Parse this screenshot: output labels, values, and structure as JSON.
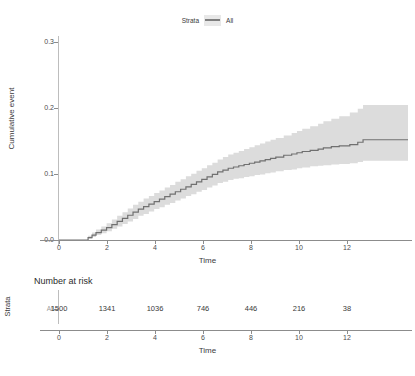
{
  "legend": {
    "title": "Strata",
    "key_icon": "line-swatch-icon",
    "label": "All"
  },
  "km_panel": {
    "y_axis_title": "Cumulative event",
    "x_axis_title": "Time",
    "y_ticks": [
      "0.0",
      "0.1",
      "0.2",
      "0.3"
    ],
    "x_ticks": [
      "0",
      "2",
      "4",
      "6",
      "8",
      "10",
      "12"
    ]
  },
  "risk_table": {
    "title": "Number at risk",
    "strata_axis_title": "Strata",
    "strata_label": "All",
    "x_axis_title": "Time",
    "x_ticks": [
      "0",
      "2",
      "4",
      "6",
      "8",
      "10",
      "12"
    ],
    "values": [
      "1500",
      "1341",
      "1036",
      "746",
      "446",
      "216",
      "38"
    ]
  },
  "colors": {
    "curve": "#707070",
    "confidence_band": "#d9d9d9",
    "axis": "#8c8c8c",
    "text": "#3a3a3a",
    "background": "#ffffff"
  },
  "chart_data": {
    "type": "line",
    "title": "",
    "subtitle": "",
    "xlabel": "Time",
    "ylabel": "Cumulative event",
    "xlim": [
      0,
      13.2
    ],
    "ylim": [
      0.0,
      0.32
    ],
    "x_ticks": [
      0,
      2,
      4,
      6,
      8,
      10,
      12
    ],
    "y_ticks": [
      0.0,
      0.1,
      0.2,
      0.3
    ],
    "grid": false,
    "legend_position": "top",
    "legend_title": "Strata",
    "series": [
      {
        "name": "All",
        "type": "step-kaplan-meier-cumulative-event",
        "color": "#707070",
        "x": [
          0.0,
          1.0,
          1.1,
          1.25,
          1.4,
          1.6,
          1.8,
          2.0,
          2.2,
          2.4,
          2.6,
          2.8,
          3.0,
          3.2,
          3.4,
          3.6,
          3.8,
          4.0,
          4.2,
          4.4,
          4.6,
          4.8,
          5.0,
          5.2,
          5.4,
          5.6,
          5.8,
          6.0,
          6.2,
          6.4,
          6.6,
          6.8,
          7.0,
          7.2,
          7.4,
          7.6,
          7.8,
          8.0,
          8.2,
          8.5,
          8.8,
          9.0,
          9.2,
          9.5,
          9.8,
          10.0,
          10.3,
          10.6,
          11.0,
          11.3,
          11.5,
          13.2
        ],
        "y": [
          0.0,
          0.0,
          0.004,
          0.008,
          0.012,
          0.016,
          0.02,
          0.025,
          0.03,
          0.035,
          0.04,
          0.045,
          0.05,
          0.054,
          0.058,
          0.062,
          0.066,
          0.07,
          0.074,
          0.078,
          0.082,
          0.086,
          0.09,
          0.094,
          0.098,
          0.102,
          0.106,
          0.11,
          0.113,
          0.116,
          0.118,
          0.12,
          0.122,
          0.124,
          0.126,
          0.128,
          0.13,
          0.132,
          0.134,
          0.137,
          0.139,
          0.141,
          0.143,
          0.145,
          0.147,
          0.149,
          0.151,
          0.152,
          0.154,
          0.158,
          0.162,
          0.162
        ],
        "ci_lower": [
          0.0,
          0.0,
          0.002,
          0.005,
          0.008,
          0.011,
          0.014,
          0.018,
          0.022,
          0.026,
          0.03,
          0.034,
          0.039,
          0.042,
          0.046,
          0.05,
          0.053,
          0.057,
          0.06,
          0.064,
          0.067,
          0.071,
          0.074,
          0.078,
          0.081,
          0.085,
          0.088,
          0.092,
          0.094,
          0.097,
          0.099,
          0.1,
          0.102,
          0.103,
          0.105,
          0.106,
          0.108,
          0.109,
          0.111,
          0.113,
          0.114,
          0.116,
          0.117,
          0.119,
          0.12,
          0.121,
          0.122,
          0.123,
          0.124,
          0.126,
          0.128,
          0.128
        ],
        "ci_upper": [
          0.0,
          0.0,
          0.007,
          0.012,
          0.017,
          0.022,
          0.027,
          0.033,
          0.039,
          0.045,
          0.051,
          0.057,
          0.062,
          0.067,
          0.071,
          0.076,
          0.08,
          0.085,
          0.089,
          0.094,
          0.098,
          0.103,
          0.107,
          0.112,
          0.116,
          0.121,
          0.125,
          0.13,
          0.134,
          0.138,
          0.141,
          0.144,
          0.147,
          0.15,
          0.153,
          0.156,
          0.159,
          0.162,
          0.165,
          0.169,
          0.173,
          0.176,
          0.18,
          0.184,
          0.188,
          0.192,
          0.196,
          0.2,
          0.206,
          0.212,
          0.218,
          0.218
        ]
      }
    ],
    "risk_table": {
      "type": "table",
      "row_label": "All",
      "times": [
        0,
        2,
        4,
        6,
        8,
        10,
        12
      ],
      "n_at_risk": [
        1500,
        1341,
        1036,
        746,
        446,
        216,
        38
      ]
    }
  }
}
